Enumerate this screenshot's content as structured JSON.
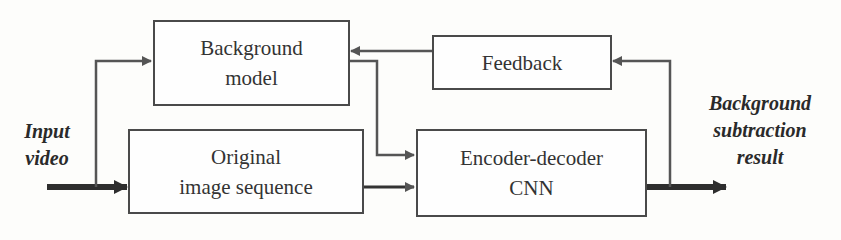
{
  "diagram": {
    "type": "block-flow",
    "nodes": {
      "background_model": {
        "line1": "Background",
        "line2": "model"
      },
      "feedback": {
        "line1": "Feedback"
      },
      "original_sequence": {
        "line1": "Original",
        "line2": "image sequence"
      },
      "encoder_decoder": {
        "line1": "Encoder-decoder",
        "line2": "CNN"
      }
    },
    "labels": {
      "input": {
        "line1": "Input",
        "line2": "video"
      },
      "output": {
        "line1": "Background",
        "line2": "subtraction",
        "line3": "result"
      }
    },
    "edges": [
      {
        "from": "Input video",
        "to": "Original image sequence"
      },
      {
        "from": "Input video",
        "to": "Background model"
      },
      {
        "from": "Feedback",
        "to": "Background model"
      },
      {
        "from": "Background model",
        "to": "Encoder-decoder CNN"
      },
      {
        "from": "Original image sequence",
        "to": "Encoder-decoder CNN"
      },
      {
        "from": "Encoder-decoder CNN",
        "to": "Background subtraction result"
      },
      {
        "from": "Encoder-decoder CNN",
        "to": "Feedback"
      }
    ],
    "colors": {
      "line": "#555555",
      "thick_line": "#2e2e2e",
      "background": "#fdfdfb"
    }
  }
}
